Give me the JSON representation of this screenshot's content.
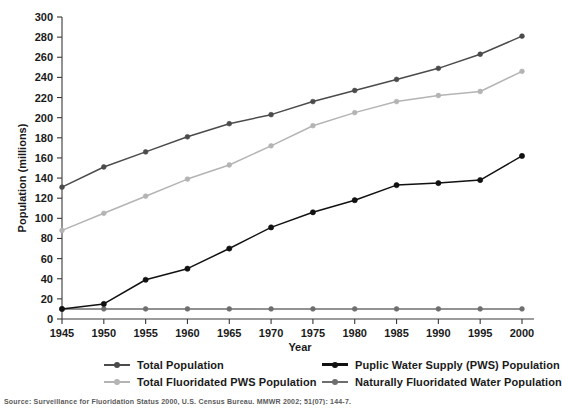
{
  "chart_data": {
    "type": "line",
    "title": "",
    "xlabel": "Year",
    "ylabel": "Population (millions)",
    "categories": [
      1945,
      1950,
      1955,
      1960,
      1965,
      1970,
      1975,
      1980,
      1985,
      1990,
      1995,
      2000
    ],
    "x_tick_labels": [
      "1945",
      "1950",
      "1955",
      "1960",
      "1965",
      "1970",
      "1975",
      "1980",
      "1985",
      "1990",
      "1995",
      "2000"
    ],
    "y_tick_labels": [
      "0",
      "20",
      "40",
      "60",
      "80",
      "100",
      "120",
      "140",
      "160",
      "180",
      "200",
      "220",
      "240",
      "260",
      "280",
      "300"
    ],
    "y_ticks": [
      0,
      20,
      40,
      60,
      80,
      100,
      120,
      140,
      160,
      180,
      200,
      220,
      240,
      260,
      280,
      300
    ],
    "xlim": [
      1945,
      2000
    ],
    "ylim": [
      0,
      300
    ],
    "grid": false,
    "legend_position": "bottom",
    "series": [
      {
        "name": "Total Population",
        "color": "#4b4b4b",
        "marker": "circle",
        "values": [
          131,
          151,
          166,
          181,
          194,
          203,
          216,
          227,
          238,
          249,
          263,
          281
        ]
      },
      {
        "name": "Puplic Water Supply (PWS) Population",
        "color": "#111111",
        "marker": "circle",
        "values": [
          10,
          15,
          39,
          50,
          70,
          91,
          106,
          118,
          133,
          135,
          138,
          162
        ]
      },
      {
        "name": "Total Fluoridated PWS Population",
        "color": "#b4b4b4",
        "marker": "circle",
        "values": [
          88,
          105,
          122,
          139,
          153,
          172,
          192,
          205,
          216,
          222,
          226,
          246
        ]
      },
      {
        "name": "Naturally Fluoridated Water Population",
        "color": "#6e6e6e",
        "marker": "circle",
        "values": [
          10,
          10,
          10,
          10,
          10,
          10,
          10,
          10,
          10,
          10,
          10,
          10
        ]
      }
    ]
  },
  "legend": {
    "items": [
      {
        "label": "Total Population",
        "color": "#4b4b4b",
        "column": "left"
      },
      {
        "label": "Total Fluoridated PWS Population",
        "color": "#b4b4b4",
        "column": "left"
      },
      {
        "label": "Puplic Water Supply (PWS) Population",
        "color": "#111111",
        "column": "right"
      },
      {
        "label": "Naturally Fluoridated Water Population",
        "color": "#6e6e6e",
        "column": "right"
      }
    ]
  },
  "source_note": {
    "text": "Source: Surveillance for Fluoridation Status 2000, U.S. Census Bureau. MMWR 2002; 51(07): 144-7."
  }
}
